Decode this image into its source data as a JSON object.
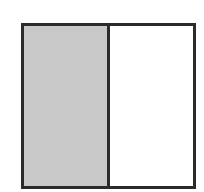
{
  "diagram": {
    "shape": "square",
    "divisions": 2,
    "orientation": "vertical",
    "parts": [
      {
        "index": 0,
        "shaded": true,
        "fill": "#c8c8c8"
      },
      {
        "index": 1,
        "shaded": false,
        "fill": "#ffffff"
      }
    ],
    "shaded_count": 1,
    "fraction_shaded": "1/2",
    "border_color": "#2b2b2b"
  }
}
